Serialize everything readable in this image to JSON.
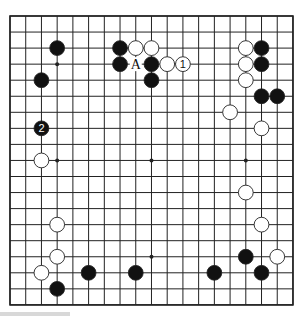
{
  "board": {
    "size": 19,
    "origin": {
      "x": 10,
      "y": 16
    },
    "spacing": {
      "x": 15.72,
      "y": 16.05
    },
    "colors": {
      "background": "#ffffff",
      "line": "#222222",
      "black": "#111111",
      "white": "#ffffff",
      "stone_outline": "#222222"
    },
    "star_points": [
      [
        3,
        3
      ],
      [
        3,
        9
      ],
      [
        9,
        9
      ],
      [
        15,
        9
      ],
      [
        3,
        15
      ],
      [
        9,
        15
      ],
      [
        15,
        15
      ],
      [
        9,
        3
      ],
      [
        15,
        3
      ]
    ],
    "stones": [
      {
        "col": 3,
        "row": 2,
        "color": "black"
      },
      {
        "col": 2,
        "row": 4,
        "color": "black"
      },
      {
        "col": 2,
        "row": 7,
        "color": "black",
        "label": "2"
      },
      {
        "col": 2,
        "row": 9,
        "color": "white"
      },
      {
        "col": 7,
        "row": 2,
        "color": "black"
      },
      {
        "col": 8,
        "row": 2,
        "color": "white"
      },
      {
        "col": 9,
        "row": 2,
        "color": "white"
      },
      {
        "col": 7,
        "row": 3,
        "color": "black"
      },
      {
        "col": 9,
        "row": 3,
        "color": "black"
      },
      {
        "col": 10,
        "row": 3,
        "color": "white"
      },
      {
        "col": 11,
        "row": 3,
        "color": "white",
        "label": "1"
      },
      {
        "col": 9,
        "row": 4,
        "color": "black"
      },
      {
        "col": 15,
        "row": 2,
        "color": "white"
      },
      {
        "col": 16,
        "row": 2,
        "color": "black"
      },
      {
        "col": 15,
        "row": 3,
        "color": "white"
      },
      {
        "col": 16,
        "row": 3,
        "color": "black"
      },
      {
        "col": 15,
        "row": 4,
        "color": "white"
      },
      {
        "col": 16,
        "row": 5,
        "color": "black"
      },
      {
        "col": 17,
        "row": 5,
        "color": "black"
      },
      {
        "col": 14,
        "row": 6,
        "color": "white"
      },
      {
        "col": 16,
        "row": 7,
        "color": "white"
      },
      {
        "col": 15,
        "row": 11,
        "color": "white"
      },
      {
        "col": 16,
        "row": 13,
        "color": "white"
      },
      {
        "col": 15,
        "row": 15,
        "color": "black"
      },
      {
        "col": 17,
        "row": 15,
        "color": "white"
      },
      {
        "col": 13,
        "row": 16,
        "color": "black"
      },
      {
        "col": 16,
        "row": 16,
        "color": "black"
      },
      {
        "col": 3,
        "row": 13,
        "color": "white"
      },
      {
        "col": 3,
        "row": 15,
        "color": "white"
      },
      {
        "col": 2,
        "row": 16,
        "color": "white"
      },
      {
        "col": 3,
        "row": 17,
        "color": "black"
      },
      {
        "col": 5,
        "row": 16,
        "color": "black"
      },
      {
        "col": 8,
        "row": 16,
        "color": "black"
      }
    ],
    "markers": [
      {
        "col": 8,
        "row": 3,
        "label": "A"
      }
    ]
  }
}
